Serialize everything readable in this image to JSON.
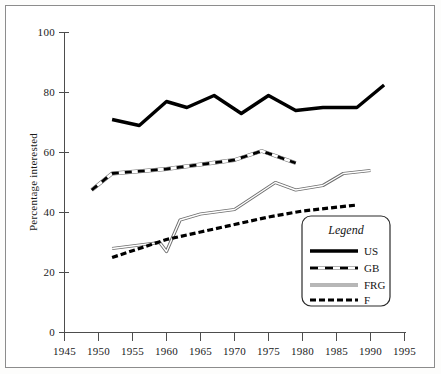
{
  "chart_data": {
    "type": "line",
    "title": "",
    "xlabel": "",
    "ylabel": "Percentage interested",
    "xlim": [
      1945,
      1995
    ],
    "ylim": [
      0,
      100
    ],
    "xticks": [
      1945,
      1950,
      1955,
      1960,
      1965,
      1970,
      1975,
      1980,
      1985,
      1990,
      1995
    ],
    "yticks": [
      0,
      20,
      40,
      60,
      80,
      100
    ],
    "xtick_labels": [
      "1945",
      "1950",
      "1955",
      "1960",
      "1965",
      "1970",
      "1975",
      "1980",
      "1985",
      "1990",
      "1995"
    ],
    "ytick_labels": [
      "0",
      "20",
      "40",
      "60",
      "80",
      "100"
    ],
    "grid": false,
    "legend_position": "lower-right",
    "legend_title": "Legend",
    "series": [
      {
        "name": "US",
        "style": "thick-solid-black",
        "color": "#000000",
        "x": [
          1952,
          1956,
          1960,
          1963,
          1967,
          1971,
          1975,
          1979,
          1983,
          1988,
          1992
        ],
        "y": [
          71,
          69,
          77,
          75,
          79,
          73,
          79,
          74,
          75,
          75,
          82.5
        ]
      },
      {
        "name": "GB",
        "style": "black-dash-on-white",
        "color": "#000000",
        "x": [
          1949,
          1952,
          1960,
          1965,
          1970,
          1974,
          1979
        ],
        "y": [
          47.5,
          53,
          54.5,
          56,
          57.5,
          60.5,
          56.5
        ]
      },
      {
        "name": "FRG",
        "style": "thin-double-line",
        "color": "#808080",
        "x": [
          1952,
          1959,
          1960,
          1962,
          1965,
          1970,
          1976,
          1979,
          1983,
          1986,
          1990
        ],
        "y": [
          28,
          30,
          27,
          37.5,
          39.5,
          41,
          50,
          47.5,
          49,
          53,
          54
        ]
      },
      {
        "name": "F",
        "style": "thick-black-dash",
        "color": "#000000",
        "x": [
          1952,
          1960,
          1965,
          1970,
          1975,
          1980,
          1984,
          1988
        ],
        "y": [
          25,
          31,
          33.5,
          36,
          38.5,
          40.5,
          41.5,
          42.5
        ]
      }
    ]
  },
  "legend": {
    "title": "Legend",
    "entries": [
      {
        "label": "US"
      },
      {
        "label": "GB"
      },
      {
        "label": "FRG"
      },
      {
        "label": "F"
      }
    ]
  },
  "axes": {
    "y_title": "Percentage interested"
  }
}
